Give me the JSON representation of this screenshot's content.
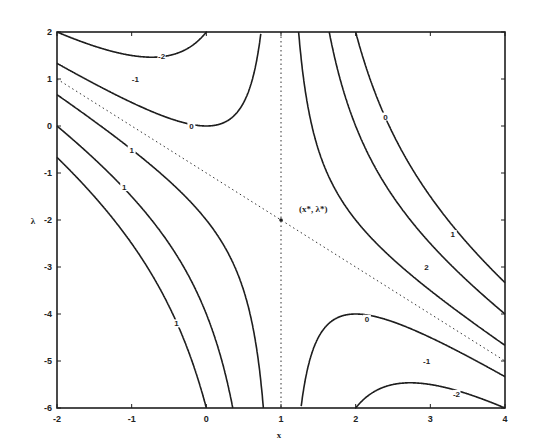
{
  "chart_data": {
    "type": "contour",
    "title": "",
    "xlabel": "x",
    "ylabel": "λ",
    "xlim": [
      -2,
      4
    ],
    "ylim": [
      -6,
      2
    ],
    "xticks": [
      "-2",
      "-1",
      "0",
      "1",
      "2",
      "3",
      "4"
    ],
    "yticks": [
      "2",
      "1",
      "0",
      "-1",
      "-2",
      "-3",
      "-4",
      "-5",
      "-6"
    ],
    "grid": false,
    "function_form": "(x - 1) * (λ + x + 1)",
    "saddle_point": {
      "x": 1,
      "y": -2,
      "label": "(x*, λ*)"
    },
    "asymptotes": [
      {
        "type": "vertical",
        "x": 1,
        "style": "dotted"
      },
      {
        "type": "line",
        "from": [
          -2,
          1
        ],
        "to": [
          4,
          -5
        ],
        "style": "dotted"
      }
    ],
    "contour_levels": [
      -5,
      -3,
      -1,
      1,
      3,
      5
    ],
    "contour_labels": [
      {
        "text": "-2",
        "x": -0.6,
        "y": 1.5
      },
      {
        "text": "-1",
        "x": -0.95,
        "y": 1.0
      },
      {
        "text": "0",
        "x": -0.2,
        "y": 0.0
      },
      {
        "text": "1",
        "x": -1.0,
        "y": -0.5
      },
      {
        "text": "1",
        "x": -1.1,
        "y": -1.3
      },
      {
        "text": "1",
        "x": -0.4,
        "y": -4.2
      },
      {
        "text": "0",
        "x": 2.4,
        "y": 0.2
      },
      {
        "text": "1",
        "x": 3.3,
        "y": -2.3
      },
      {
        "text": "2",
        "x": 2.95,
        "y": -3.0
      },
      {
        "text": "0",
        "x": 2.15,
        "y": -4.1
      },
      {
        "text": "-1",
        "x": 2.95,
        "y": -5.0
      },
      {
        "text": "-2",
        "x": 3.35,
        "y": -5.7
      }
    ]
  }
}
